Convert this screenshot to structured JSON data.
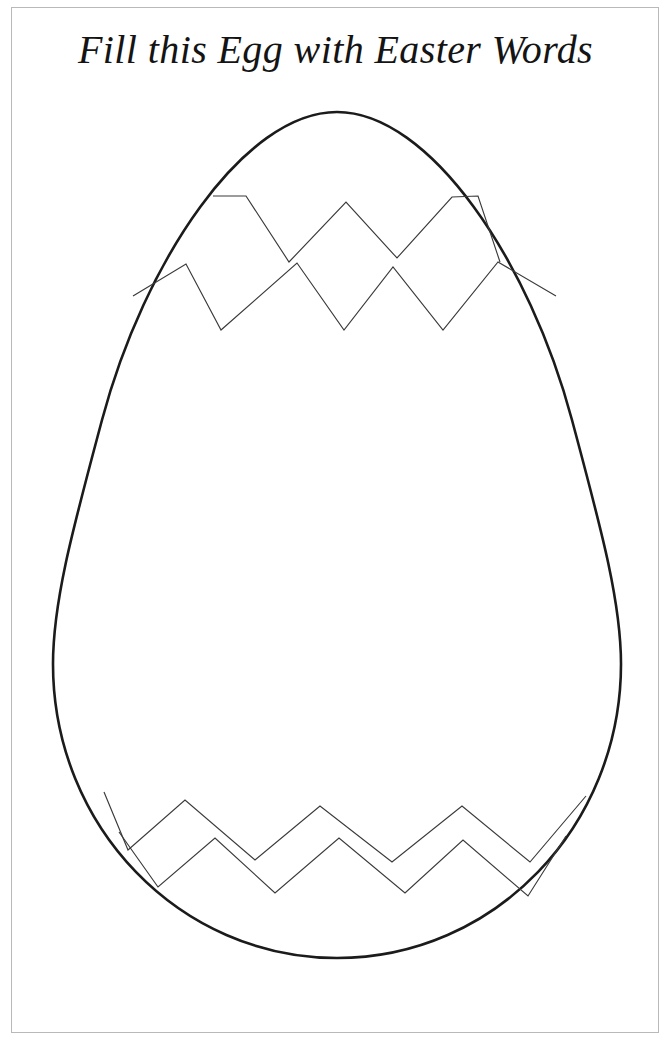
{
  "page": {
    "width": 671,
    "height": 1044,
    "background_color": "#ffffff",
    "border_color": "#b9b9bd"
  },
  "title": {
    "text": "Fill this Egg with Easter Words",
    "color": "#141414"
  },
  "egg": {
    "name": "easter-egg-outline",
    "outline_color": "#1b1b1b",
    "fill_color": "#ffffff",
    "crack_color": "#3a3a3a",
    "bounds": {
      "left": 53,
      "top": 112,
      "right": 621,
      "bottom": 958
    },
    "cracks": {
      "top": {
        "count": 2,
        "upper_points": "213,196 246,196 289,262 346,202 397,258 452,197 478,196 500,262",
        "lower_points": "133,296 186,264 221,330 297,263 344,330 393,267 443,330 498,262 556,296"
      },
      "bottom": {
        "count": 2,
        "upper_points": "104,792 128,850 185,800 255,860 320,806 392,862 462,806 530,862 586,796",
        "lower_points": "119,832 158,887 215,838 275,893 339,838 405,893 463,840 528,896 566,836"
      }
    }
  },
  "write_area": {
    "name": "egg-writing-area",
    "hint": ""
  }
}
